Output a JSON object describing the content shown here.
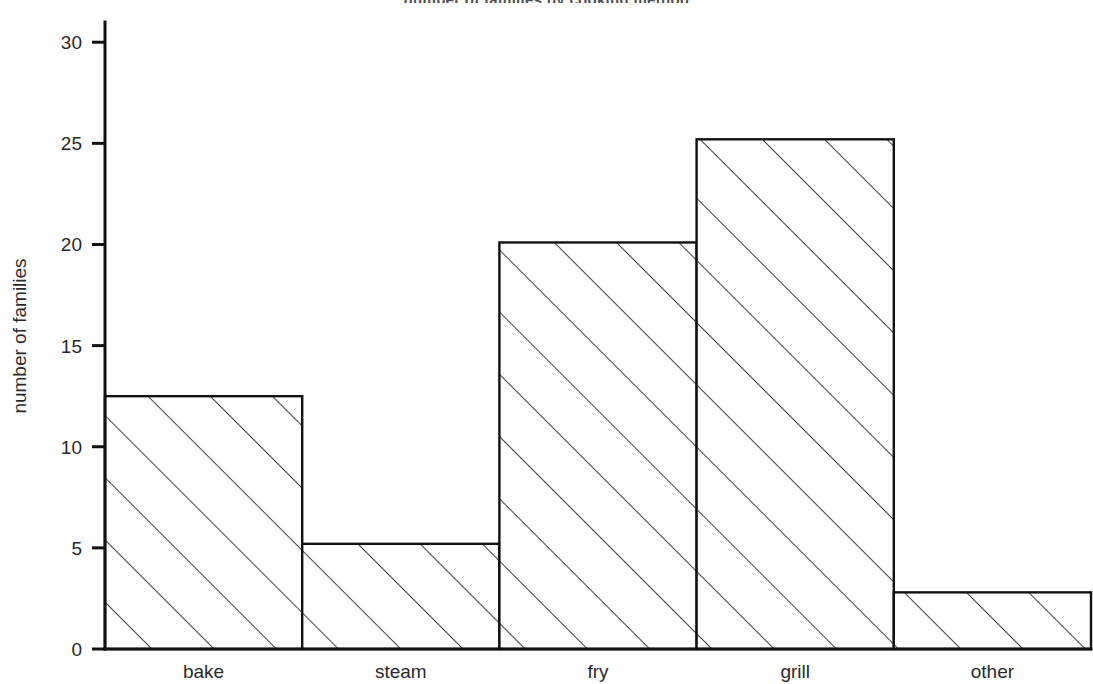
{
  "chart_data": {
    "type": "bar",
    "title": "number of families by cooking method",
    "categories": [
      "bake",
      "steam",
      "fry",
      "grill",
      "other"
    ],
    "values": [
      12.5,
      5.2,
      20.1,
      25.2,
      2.8
    ],
    "xlabel": "",
    "ylabel": "number of families",
    "ylim": [
      0,
      31
    ],
    "yticks": [
      0,
      5,
      10,
      15,
      20,
      25,
      30
    ],
    "ytick_labels": [
      "0",
      "5",
      "10",
      "15",
      "20",
      "25",
      "30"
    ],
    "grid": false,
    "legend": false,
    "style": "hatched-histogram",
    "fill_pattern": "diagonal-hatch-45",
    "line_color": "#111111",
    "background_color": "#ffffff"
  },
  "axes": {
    "y_axis_title": "number of families"
  }
}
